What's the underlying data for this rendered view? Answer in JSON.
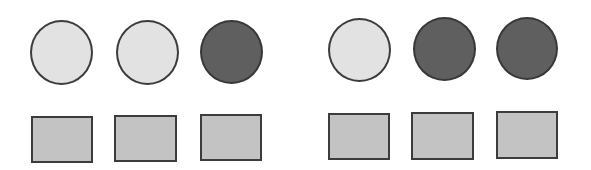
{
  "diagram": {
    "groups": [
      {
        "name": "left-group",
        "circles": [
          {
            "shade": "light",
            "x": 30,
            "y": 20,
            "w": 63,
            "h": 65
          },
          {
            "shade": "light",
            "x": 116,
            "y": 20,
            "w": 63,
            "h": 65
          },
          {
            "shade": "dark",
            "x": 200,
            "y": 20,
            "w": 63,
            "h": 64
          }
        ],
        "squares": [
          {
            "x": 31,
            "y": 116,
            "w": 62,
            "h": 47
          },
          {
            "x": 114,
            "y": 115,
            "w": 63,
            "h": 47
          },
          {
            "x": 200,
            "y": 114,
            "w": 62,
            "h": 47
          }
        ]
      },
      {
        "name": "right-group",
        "circles": [
          {
            "shade": "light",
            "x": 328,
            "y": 18,
            "w": 63,
            "h": 64
          },
          {
            "shade": "dark",
            "x": 413,
            "y": 17,
            "w": 63,
            "h": 64
          },
          {
            "shade": "dark",
            "x": 496,
            "y": 17,
            "w": 62,
            "h": 63
          }
        ],
        "squares": [
          {
            "x": 328,
            "y": 113,
            "w": 62,
            "h": 47
          },
          {
            "x": 411,
            "y": 112,
            "w": 63,
            "h": 48
          },
          {
            "x": 496,
            "y": 111,
            "w": 62,
            "h": 48
          }
        ]
      }
    ],
    "colors": {
      "light_circle": "#e2e2e2",
      "dark_circle": "#5f5f5f",
      "square": "#c3c3c3",
      "stroke": "#3c3c3c"
    }
  }
}
